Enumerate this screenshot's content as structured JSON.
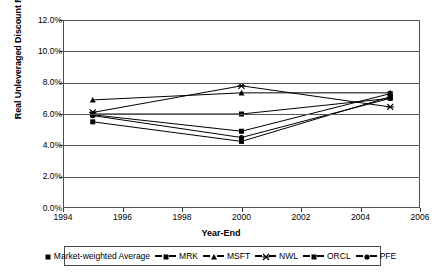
{
  "chart_data": {
    "type": "line",
    "title": "",
    "xlabel": "Year-End",
    "ylabel": "Real Unleveraged Discount Rates",
    "x": [
      1995,
      2000,
      2005
    ],
    "xlim": [
      1994,
      2006
    ],
    "ylim": [
      0.0,
      12.0
    ],
    "xticks": [
      "1994",
      "1996",
      "1998",
      "2000",
      "2002",
      "2004",
      "2006"
    ],
    "xtick_values": [
      1994,
      1996,
      1998,
      2000,
      2002,
      2004,
      2006
    ],
    "yticks": [
      "0.0%",
      "2.0%",
      "4.0%",
      "6.0%",
      "8.0%",
      "10.0%",
      "12.0%"
    ],
    "ytick_values": [
      0.0,
      2.0,
      4.0,
      6.0,
      8.0,
      10.0,
      12.0
    ],
    "grid": "horizontal",
    "legend_position": "bottom",
    "series": [
      {
        "name": "Market-weighted Average",
        "marker": "square",
        "values": [
          6.0,
          6.0,
          7.0
        ]
      },
      {
        "name": "MRK",
        "marker": "square",
        "values": [
          5.95,
          4.9,
          7.3
        ]
      },
      {
        "name": "MSFT",
        "marker": "triangle",
        "values": [
          6.9,
          7.35,
          7.35
        ]
      },
      {
        "name": "NWL",
        "marker": "cross",
        "values": [
          6.1,
          7.8,
          6.45
        ]
      },
      {
        "name": "ORCL",
        "marker": "square",
        "values": [
          5.5,
          4.25,
          7.1
        ]
      },
      {
        "name": "PFE",
        "marker": "circle",
        "values": [
          5.9,
          4.5,
          7.0
        ]
      }
    ]
  },
  "legend": {
    "items": [
      {
        "label": "Market-weighted Average",
        "marker": "square",
        "show_line": false
      },
      {
        "label": "MRK",
        "marker": "square",
        "show_line": true
      },
      {
        "label": "MSFT",
        "marker": "triangle",
        "show_line": true
      },
      {
        "label": "NWL",
        "marker": "cross",
        "show_line": true
      },
      {
        "label": "ORCL",
        "marker": "square",
        "show_line": true
      },
      {
        "label": "PFE",
        "marker": "circle",
        "show_line": true
      }
    ]
  },
  "colors": {
    "series": "#000000",
    "grid": "#555555",
    "border": "#4a4a4a",
    "background": "#ffffff"
  }
}
